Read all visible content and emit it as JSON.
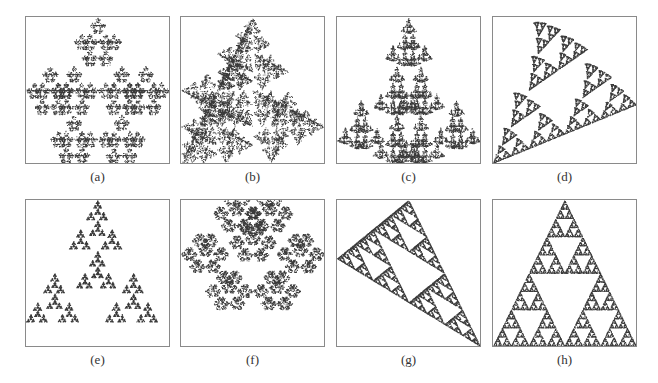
{
  "figure": {
    "panels": [
      {
        "id": "a",
        "label": "(a)",
        "shape": "hexaflake-triangle-fractal",
        "row": 0,
        "col": 0
      },
      {
        "id": "b",
        "label": "(b)",
        "shape": "rectilinear-pinwheel-fractal",
        "row": 0,
        "col": 1
      },
      {
        "id": "c",
        "label": "(c)",
        "shape": "cross-tree-fractal",
        "row": 0,
        "col": 2
      },
      {
        "id": "d",
        "label": "(d)",
        "shape": "diagonal-branching-fractal",
        "row": 0,
        "col": 3
      },
      {
        "id": "e",
        "label": "(e)",
        "shape": "clustered-cross-fractal",
        "row": 1,
        "col": 0
      },
      {
        "id": "f",
        "label": "(f)",
        "shape": "triangular-snowflake-fractal",
        "row": 1,
        "col": 1
      },
      {
        "id": "g",
        "label": "(g)",
        "shape": "sheared-sierpinski-fractal",
        "row": 1,
        "col": 2
      },
      {
        "id": "h",
        "label": "(h)",
        "shape": "inverted-sierpinski-fractal",
        "row": 1,
        "col": 3
      }
    ],
    "colors": {
      "ink": "#3a3a3a",
      "frame": "#8a8a8a",
      "background": "#ffffff"
    }
  }
}
